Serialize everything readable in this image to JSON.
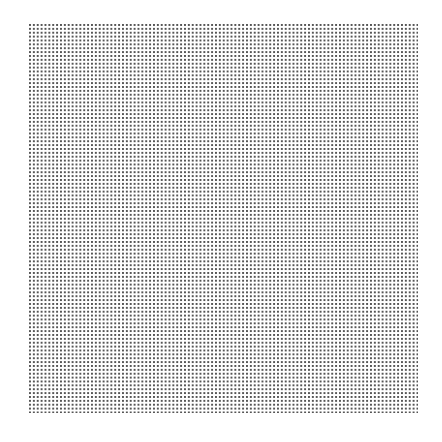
{
  "canvas": {
    "background_color": "#ffffff",
    "pattern": "dot-grid",
    "dot_color": "#555555",
    "rows": 100,
    "columns": 100,
    "grid_bounds": {
      "left": 29,
      "top": 24,
      "right": 418,
      "bottom": 413
    }
  }
}
